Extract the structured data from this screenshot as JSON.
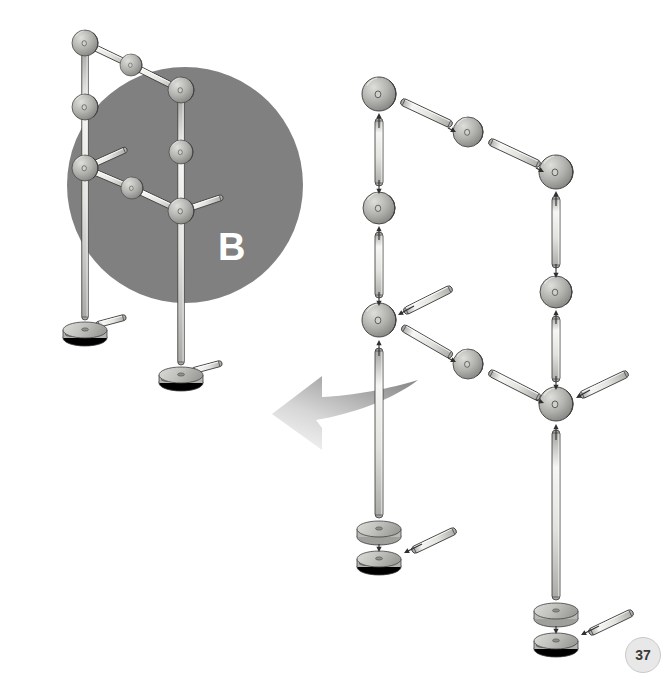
{
  "page": {
    "number": "37",
    "background_color": "#ffffff",
    "type": "assembly-instruction-diagram"
  },
  "step_badge": {
    "label": "B",
    "text_color": "#ffffff",
    "circle_color": "#808080",
    "circle": {
      "cx": 185,
      "cy": 185,
      "r": 118
    }
  },
  "arrow": {
    "name": "curved-transfer-arrow",
    "fill_start": "#9a9a9a",
    "fill_end": "#f2f2f2",
    "direction": "up-left"
  },
  "palette": {
    "rod_light": "#f4f4f2",
    "rod_mid": "#cfcfcb",
    "rod_dark": "#9a9a96",
    "connector_light": "#dcdcd8",
    "connector_mid": "#b0b0ac",
    "connector_dark": "#7e7e7a",
    "outline": "#3f3f3f",
    "badge_gray": "#808080",
    "pagenum_bg": "#e8e8e8"
  },
  "assembled_model": {
    "name": "assembled-structure-b",
    "description": "Completed two-post frame assembly shown over grey circle",
    "connectors": [
      {
        "id": "a-c1",
        "x": 85,
        "y": 43,
        "r": 13
      },
      {
        "id": "a-c2",
        "x": 131,
        "y": 65,
        "r": 11
      },
      {
        "id": "a-c3",
        "x": 181,
        "y": 90,
        "r": 13
      },
      {
        "id": "a-c4",
        "x": 85,
        "y": 107,
        "r": 13
      },
      {
        "id": "a-c5",
        "x": 181,
        "y": 152,
        "r": 12
      },
      {
        "id": "a-c6",
        "x": 85,
        "y": 168,
        "r": 13
      },
      {
        "id": "a-c7",
        "x": 132,
        "y": 188,
        "r": 11
      },
      {
        "id": "a-c8",
        "x": 181,
        "y": 211,
        "r": 13
      }
    ],
    "posts": [
      {
        "id": "a-post-left",
        "x": 85,
        "y1": 43,
        "y2": 320
      },
      {
        "id": "a-post-right",
        "x": 181,
        "y1": 90,
        "y2": 365
      }
    ],
    "rods": [
      {
        "id": "a-rod-top-1",
        "x1": 85,
        "y1": 43,
        "x2": 131,
        "y2": 65
      },
      {
        "id": "a-rod-top-2",
        "x1": 131,
        "y1": 65,
        "x2": 181,
        "y2": 90
      },
      {
        "id": "a-rod-mid-1",
        "x1": 85,
        "y1": 168,
        "x2": 132,
        "y2": 188
      },
      {
        "id": "a-rod-mid-2",
        "x1": 132,
        "y1": 188,
        "x2": 181,
        "y2": 211
      },
      {
        "id": "a-rod-spur-1",
        "x1": 85,
        "y1": 168,
        "x2": 127,
        "y2": 149
      },
      {
        "id": "a-rod-spur-2",
        "x1": 181,
        "y1": 211,
        "x2": 223,
        "y2": 197
      },
      {
        "id": "a-rod-foot-1",
        "x1": 96,
        "y1": 325,
        "x2": 126,
        "y2": 317
      },
      {
        "id": "a-rod-foot-2",
        "x1": 192,
        "y1": 371,
        "x2": 222,
        "y2": 363
      }
    ],
    "bases": [
      {
        "id": "a-base-left",
        "x": 85,
        "y": 330
      },
      {
        "id": "a-base-right",
        "x": 181,
        "y": 375
      }
    ]
  },
  "exploded_model": {
    "name": "exploded-assembly-view",
    "description": "Exploded parts diagram with insertion arrows showing how rods, connectors and bases fit together",
    "connectors": [
      {
        "id": "e-c1",
        "x": 379,
        "y": 94,
        "r": 17
      },
      {
        "id": "e-c2",
        "x": 468,
        "y": 132,
        "r": 15
      },
      {
        "id": "e-c3",
        "x": 556,
        "y": 172,
        "r": 17
      },
      {
        "id": "e-c4",
        "x": 379,
        "y": 208,
        "r": 16
      },
      {
        "id": "e-c5",
        "x": 556,
        "y": 292,
        "r": 16
      },
      {
        "id": "e-c6",
        "x": 379,
        "y": 320,
        "r": 17
      },
      {
        "id": "e-c7",
        "x": 468,
        "y": 364,
        "r": 15
      },
      {
        "id": "e-c8",
        "x": 556,
        "y": 404,
        "r": 17
      }
    ],
    "rods": [
      {
        "id": "e-rod-v1",
        "x1": 379,
        "y1": 118,
        "x2": 379,
        "y2": 186
      },
      {
        "id": "e-rod-v2",
        "x1": 379,
        "y1": 232,
        "x2": 379,
        "y2": 298
      },
      {
        "id": "e-rod-v3",
        "x1": 379,
        "y1": 348,
        "x2": 379,
        "y2": 518
      },
      {
        "id": "e-rod-v4",
        "x1": 556,
        "y1": 196,
        "x2": 556,
        "y2": 268
      },
      {
        "id": "e-rod-v5",
        "x1": 556,
        "y1": 316,
        "x2": 556,
        "y2": 382
      },
      {
        "id": "e-rod-v6",
        "x1": 556,
        "y1": 430,
        "x2": 556,
        "y2": 600
      },
      {
        "id": "e-rod-d1",
        "x1": 401,
        "y1": 101,
        "x2": 452,
        "y2": 125
      },
      {
        "id": "e-rod-d2",
        "x1": 489,
        "y1": 141,
        "x2": 540,
        "y2": 165
      },
      {
        "id": "e-rod-d3",
        "x1": 402,
        "y1": 327,
        "x2": 452,
        "y2": 356
      },
      {
        "id": "e-rod-d4",
        "x1": 489,
        "y1": 372,
        "x2": 540,
        "y2": 398
      },
      {
        "id": "e-rod-s1",
        "x1": 404,
        "y1": 312,
        "x2": 452,
        "y2": 288
      },
      {
        "id": "e-rod-s2",
        "x1": 580,
        "y1": 396,
        "x2": 628,
        "y2": 373
      },
      {
        "id": "e-rod-s3",
        "x1": 412,
        "y1": 551,
        "x2": 456,
        "y2": 530
      },
      {
        "id": "e-rod-s4",
        "x1": 589,
        "y1": 633,
        "x2": 633,
        "y2": 612
      }
    ],
    "bases": [
      {
        "id": "e-base-top-left",
        "x": 379,
        "y": 530
      },
      {
        "id": "e-base-bottom-left",
        "x": 379,
        "y": 559
      },
      {
        "id": "e-base-top-right",
        "x": 556,
        "y": 612
      },
      {
        "id": "e-base-bottom-right",
        "x": 556,
        "y": 641
      }
    ],
    "insertion_arrows": [
      {
        "id": "ar1",
        "x1": 379,
        "y1": 128,
        "x2": 379,
        "y2": 113
      },
      {
        "id": "ar2",
        "x1": 379,
        "y1": 180,
        "x2": 379,
        "y2": 194
      },
      {
        "id": "ar3",
        "x1": 379,
        "y1": 240,
        "x2": 379,
        "y2": 226
      },
      {
        "id": "ar4",
        "x1": 379,
        "y1": 292,
        "x2": 379,
        "y2": 306
      },
      {
        "id": "ar5",
        "x1": 379,
        "y1": 356,
        "x2": 379,
        "y2": 340
      },
      {
        "id": "ar6",
        "x1": 556,
        "y1": 206,
        "x2": 556,
        "y2": 191
      },
      {
        "id": "ar7",
        "x1": 556,
        "y1": 264,
        "x2": 556,
        "y2": 278
      },
      {
        "id": "ar8",
        "x1": 556,
        "y1": 324,
        "x2": 556,
        "y2": 310
      },
      {
        "id": "ar9",
        "x1": 556,
        "y1": 376,
        "x2": 556,
        "y2": 390
      },
      {
        "id": "ar10",
        "x1": 556,
        "y1": 440,
        "x2": 556,
        "y2": 424
      },
      {
        "id": "ar11",
        "x1": 448,
        "y1": 128,
        "x2": 456,
        "y2": 132
      },
      {
        "id": "ar12",
        "x1": 536,
        "y1": 168,
        "x2": 544,
        "y2": 172
      },
      {
        "id": "ar13",
        "x1": 414,
        "y1": 306,
        "x2": 398,
        "y2": 315
      },
      {
        "id": "ar14",
        "x1": 448,
        "y1": 358,
        "x2": 456,
        "y2": 362
      },
      {
        "id": "ar15",
        "x1": 536,
        "y1": 400,
        "x2": 544,
        "y2": 403
      },
      {
        "id": "ar16",
        "x1": 590,
        "y1": 390,
        "x2": 576,
        "y2": 398
      },
      {
        "id": "ar17",
        "x1": 379,
        "y1": 544,
        "x2": 379,
        "y2": 552
      },
      {
        "id": "ar18",
        "x1": 422,
        "y1": 544,
        "x2": 404,
        "y2": 553
      },
      {
        "id": "ar19",
        "x1": 556,
        "y1": 626,
        "x2": 556,
        "y2": 634
      },
      {
        "id": "ar20",
        "x1": 599,
        "y1": 626,
        "x2": 581,
        "y2": 635
      }
    ]
  }
}
